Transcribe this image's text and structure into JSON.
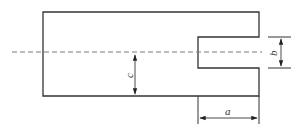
{
  "diagram": {
    "type": "mechanical-drawing",
    "colors": {
      "outline": "#333333",
      "centerline": "#7a7a7a",
      "dimension": "#333333",
      "background": "#ffffff"
    },
    "dimensions": {
      "a": {
        "label": "a",
        "meaning": "slot depth (horizontal width of right portion)"
      },
      "b": {
        "label": "b",
        "meaning": "slot width (vertical opening)"
      },
      "c": {
        "label": "c",
        "meaning": "distance from centerline to bottom edge"
      }
    }
  }
}
